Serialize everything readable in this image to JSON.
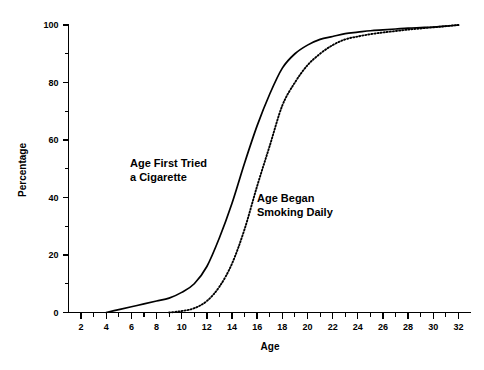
{
  "chart_data": {
    "type": "line",
    "title": "",
    "xlabel": "Age",
    "ylabel": "Percentage",
    "xlim": [
      1,
      33
    ],
    "ylim": [
      0,
      100
    ],
    "grid": false,
    "legend_position": "inline-annotations",
    "x_ticks_major": [
      2,
      4,
      6,
      8,
      10,
      12,
      14,
      16,
      18,
      20,
      22,
      24,
      26,
      28,
      30,
      32
    ],
    "x_tick_labels": [
      "2",
      "4",
      "6",
      "8",
      "10",
      "12",
      "14",
      "16",
      "18",
      "20",
      "22",
      "24",
      "26",
      "28",
      "30",
      "32"
    ],
    "x_ticks_minor": [
      3,
      5,
      7,
      9,
      11,
      13,
      15,
      17,
      19,
      21,
      23,
      25,
      27,
      29,
      31
    ],
    "y_ticks_major": [
      0,
      20,
      40,
      60,
      80,
      100
    ],
    "y_tick_labels": [
      "0",
      "20",
      "40",
      "60",
      "80",
      "100"
    ],
    "y_ticks_minor": [
      10,
      30,
      50,
      70,
      90
    ],
    "series": [
      {
        "name": "Age First Tried a Cigarette",
        "style": "solid",
        "annotation": {
          "line1": "Age First Tried",
          "line2": "a Cigarette"
        },
        "x": [
          4,
          5,
          6,
          7,
          8,
          9,
          10,
          11,
          12,
          13,
          14,
          15,
          16,
          17,
          18,
          19,
          20,
          21,
          22,
          23,
          24,
          25,
          26,
          27,
          28,
          29,
          30,
          31,
          32
        ],
        "y": [
          0,
          1,
          2,
          3,
          4,
          5,
          7,
          10,
          16,
          26,
          38,
          52,
          65,
          76,
          85,
          90,
          93,
          95,
          96,
          97,
          97.5,
          98,
          98.3,
          98.6,
          98.9,
          99.1,
          99.3,
          99.6,
          100
        ]
      },
      {
        "name": "Age Began Smoking Daily",
        "style": "dotted",
        "annotation": {
          "line1": "Age Began",
          "line2": "Smoking Daily"
        },
        "x": [
          9,
          10,
          11,
          12,
          13,
          14,
          15,
          16,
          17,
          18,
          19,
          20,
          21,
          22,
          23,
          24,
          25,
          26,
          27,
          28,
          29,
          30,
          31,
          32
        ],
        "y": [
          0,
          0.5,
          1.5,
          4,
          9,
          17,
          29,
          44,
          58,
          72,
          80,
          86,
          90,
          93,
          95,
          96,
          96.8,
          97.4,
          97.9,
          98.4,
          98.8,
          99.2,
          99.6,
          100
        ]
      }
    ],
    "colors": {
      "line": "#000000",
      "axis": "#000000",
      "background": "#ffffff"
    }
  }
}
